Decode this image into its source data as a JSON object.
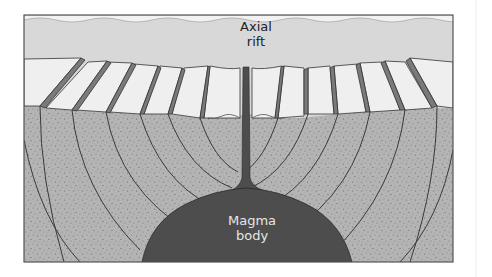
{
  "diagram": {
    "labels": {
      "axial_rift": [
        "Axial",
        "rift"
      ],
      "magma_body": [
        "Magma",
        "body"
      ]
    },
    "colors": {
      "seawater": "#d8d8d8",
      "block_top": "#efefef",
      "block_scarp": "#7a7a7a",
      "crust": "#b4b4b4",
      "crust_speckle": "#6a6a6a",
      "fault_lines": "#3a3a3a",
      "magma": "#4d4d4d",
      "frame": "#555555",
      "magma_text": "#e6e6e6",
      "rift_text": "#222222"
    },
    "frame": {
      "x": 24,
      "y": 15,
      "width": 429,
      "height": 247
    }
  }
}
